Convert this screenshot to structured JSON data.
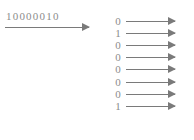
{
  "input": {
    "label": "10000010"
  },
  "outputs": [
    {
      "bit": "0"
    },
    {
      "bit": "1"
    },
    {
      "bit": "0"
    },
    {
      "bit": "0"
    },
    {
      "bit": "0"
    },
    {
      "bit": "0"
    },
    {
      "bit": "0"
    },
    {
      "bit": "1"
    }
  ],
  "colors": {
    "arrow": "#7a7a7a",
    "text": "#8c8c8c"
  }
}
